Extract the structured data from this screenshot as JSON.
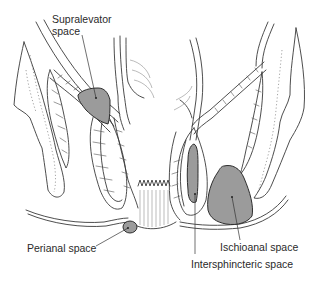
{
  "diagram": {
    "colors": {
      "space_fill": "#9b9b9b",
      "outline": "#3a3a3a",
      "background": "#ffffff"
    },
    "labels": {
      "supralevator": [
        "Supralevator",
        "space"
      ],
      "perianal": "Perianal space",
      "ischioanal": "Ischioanal space",
      "intersphincteric": "Intersphincteric space"
    }
  }
}
